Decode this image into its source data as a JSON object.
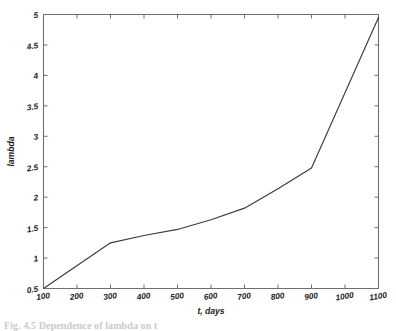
{
  "figure": {
    "caption": "Fig. 4.5 Dependence of lambda on t",
    "background_color": "#ffffff",
    "line_color": "#3a3a42",
    "axis_color": "#6e6e76"
  },
  "chart_data": {
    "type": "line",
    "title": "",
    "xlabel": "t, days",
    "ylabel": "lambda",
    "xlim": [
      100,
      1100
    ],
    "ylim": [
      0.5,
      5
    ],
    "grid": false,
    "legend": null,
    "xticks": [
      100,
      200,
      300,
      400,
      500,
      600,
      700,
      800,
      900,
      1000,
      1100
    ],
    "xtick_labels": [
      "100",
      "200",
      "300",
      "400",
      "500",
      "600",
      "700",
      "800",
      "900",
      "1000",
      "1100"
    ],
    "yticks": [
      0.5,
      1,
      1.5,
      2,
      2.5,
      3,
      3.5,
      4,
      4.5,
      5
    ],
    "ytick_labels": [
      "0.5",
      "1",
      "1.5",
      "2",
      "2.5",
      "3",
      "3.5",
      "4",
      "4.5",
      "5"
    ],
    "series": [
      {
        "name": "lambda",
        "x": [
          100,
          300,
          400,
          500,
          600,
          700,
          800,
          900,
          1100
        ],
        "values": [
          0.5,
          1.25,
          1.37,
          1.47,
          1.63,
          1.82,
          2.14,
          2.48,
          4.95
        ]
      }
    ]
  }
}
